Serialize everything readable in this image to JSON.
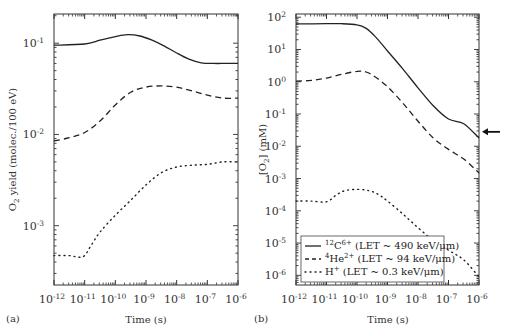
{
  "chart_data": [
    {
      "type": "line",
      "panel": "(a)",
      "xlabel": "Time (s)",
      "ylabel": "O2 yield (molec./100 eV)",
      "xscale": "log",
      "yscale": "log",
      "xlim": [
        1e-12,
        1e-06
      ],
      "ylim_log10": [
        -3.65,
        -0.68
      ],
      "x_ticks": [
        "10^-12",
        "10^-11",
        "10^-10",
        "10^-9",
        "10^-8",
        "10^-7",
        "10^-6"
      ],
      "y_ticks": [
        "10^-1",
        "10^-2",
        "10^-3"
      ],
      "series": [
        {
          "name": "12C6+ (LET ~ 490 keV/μm)",
          "style": "solid",
          "x_log10": [
            -12,
            -11,
            -10.5,
            -10,
            -9.6,
            -9.2,
            -8.8,
            -8.4,
            -8,
            -7.6,
            -7.2,
            -6.8,
            -6.4,
            -6
          ],
          "y": [
            0.095,
            0.098,
            0.108,
            0.118,
            0.124,
            0.12,
            0.108,
            0.093,
            0.078,
            0.067,
            0.061,
            0.06,
            0.06,
            0.06
          ]
        },
        {
          "name": "4He2+ (LET ~ 94 keV/μm)",
          "style": "dashed",
          "x_log10": [
            -12,
            -11.5,
            -11,
            -10.5,
            -10,
            -9.5,
            -9,
            -8.5,
            -8,
            -7.5,
            -7,
            -6.5,
            -6
          ],
          "y": [
            0.0085,
            0.0092,
            0.0105,
            0.014,
            0.021,
            0.029,
            0.033,
            0.034,
            0.033,
            0.03,
            0.027,
            0.025,
            0.025
          ]
        },
        {
          "name": "H+ (LET ~ 0.3 keV/μm)",
          "style": "dotted",
          "x_log10": [
            -12,
            -11.5,
            -11.2,
            -11,
            -10.8,
            -10.5,
            -10,
            -9.5,
            -9,
            -8.5,
            -8,
            -7.5,
            -7,
            -6.5,
            -6
          ],
          "y": [
            0.00047,
            0.00047,
            0.00045,
            0.00047,
            0.0006,
            0.00085,
            0.0013,
            0.0019,
            0.0028,
            0.0038,
            0.0044,
            0.0046,
            0.0047,
            0.005,
            0.005
          ]
        }
      ]
    },
    {
      "type": "line",
      "panel": "(b)",
      "xlabel": "Time (s)",
      "ylabel": "[O2] (mM)",
      "xscale": "log",
      "yscale": "log",
      "xlim": [
        1e-12,
        1e-06
      ],
      "ylim_log10": [
        -6.3,
        2.1
      ],
      "x_ticks": [
        "10^-12",
        "10^-11",
        "10^-10",
        "10^-9",
        "10^-8",
        "10^-7",
        "10^-6"
      ],
      "y_ticks": [
        "10^2",
        "10^1",
        "10^0",
        "10^-1",
        "10^-2",
        "10^-3",
        "10^-4",
        "10^-5",
        "10^-6"
      ],
      "annotation": {
        "type": "arrow",
        "points_to_y": 0.028,
        "side": "right"
      },
      "legend": {
        "position": "lower left"
      },
      "series": [
        {
          "name": "12C6+ (LET ~ 490 keV/μm)",
          "style": "solid",
          "x_log10": [
            -12,
            -11,
            -10.5,
            -10,
            -9.7,
            -9.4,
            -9,
            -8.5,
            -8,
            -7.5,
            -7,
            -6.5,
            -6
          ],
          "y": [
            62,
            63,
            63,
            58,
            45,
            25,
            9,
            2.5,
            0.65,
            0.18,
            0.07,
            0.05,
            0.018
          ]
        },
        {
          "name": "4He2+ (LET ~ 94 keV/μm)",
          "style": "dashed",
          "x_log10": [
            -12,
            -11.5,
            -11,
            -10.5,
            -10,
            -9.7,
            -9.4,
            -9,
            -8.5,
            -8,
            -7.5,
            -7,
            -6.5,
            -6
          ],
          "y": [
            1.05,
            1.1,
            1.3,
            1.7,
            2.1,
            2.0,
            1.4,
            0.7,
            0.22,
            0.06,
            0.018,
            0.008,
            0.004,
            0.0015
          ]
        },
        {
          "name": "H+ (LET ~ 0.3 keV/μm)",
          "style": "dotted",
          "x_log10": [
            -12,
            -11.5,
            -11,
            -10.7,
            -10.4,
            -10,
            -9.6,
            -9.3,
            -9,
            -8.5,
            -8,
            -7.5,
            -7,
            -6.5,
            -6
          ],
          "y": [
            0.0002,
            0.0002,
            0.00019,
            0.0003,
            0.00042,
            0.00046,
            0.00042,
            0.00032,
            0.0002,
            8e-05,
            3e-05,
            1.2e-05,
            6e-06,
            3e-06,
            9e-07
          ]
        }
      ]
    }
  ],
  "labels": {
    "panel_a": "(a)",
    "panel_b": "(b)",
    "xlabel": "Time (s)",
    "ylabel_a": "O2 yield (molec./100 eV)",
    "ylabel_b": "[O2] (mM)",
    "legend": [
      {
        "ion": "12",
        "sym": "C",
        "charge": "6+",
        "let": " (LET ~ 490 keV/μm)"
      },
      {
        "ion": "4",
        "sym": "He",
        "charge": "2+",
        "let": " (LET ~ 94 keV/μm)"
      },
      {
        "ion": "",
        "sym": "H",
        "charge": "+",
        "let": " (LET ~ 0.3 keV/μm)"
      }
    ]
  }
}
